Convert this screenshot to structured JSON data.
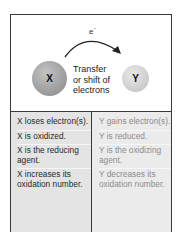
{
  "diagram": {
    "electron_label": "e",
    "electron_charge": "−",
    "caption_lines": [
      "Transfer",
      "or shift of",
      "electrons"
    ],
    "atom_x_label": "X",
    "atom_y_label": "Y",
    "colors": {
      "frame": "#3a3a3a",
      "atom_x": "#a2a2a2",
      "atom_y": "#d2d2d2",
      "x_text": "#2a2a2a",
      "y_text": "#8c8c8c",
      "table_bg": "#e4e4e4"
    }
  },
  "table": {
    "x_column": [
      "X loses electron(s).",
      "X is oxidized.",
      "X is the reducing agent.",
      "X increases its oxidation number."
    ],
    "y_column": [
      "Y gains electron(s).",
      "Y is reduced.",
      "Y is the oxidizing agent.",
      "Y decreases its oxidation number."
    ]
  }
}
